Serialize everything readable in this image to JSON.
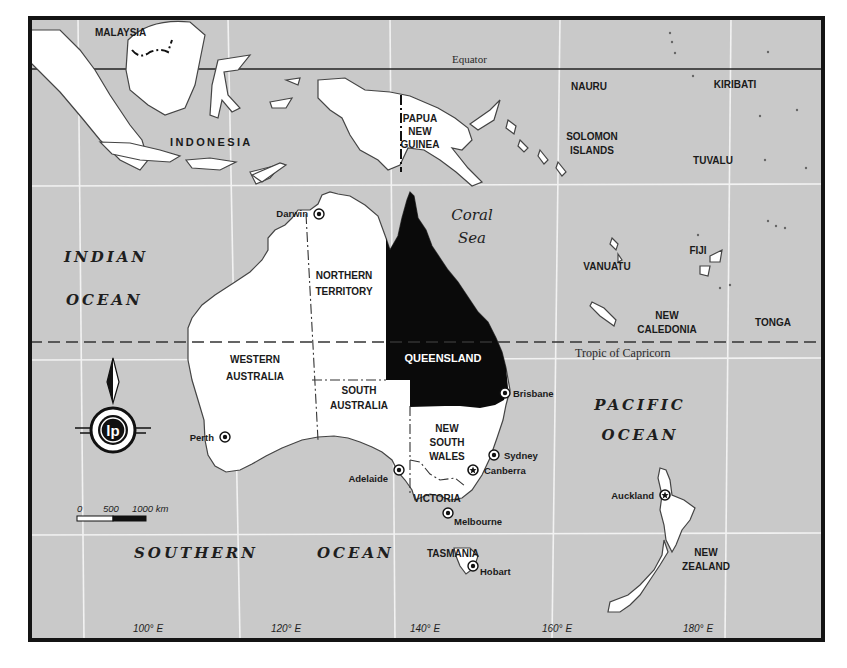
{
  "map": {
    "colors": {
      "sea": "#c9c9c9",
      "land": "#ffffff",
      "highlight_state": "#0a0a0a",
      "frame": "#141414",
      "graticule": "#f2f2f2"
    },
    "reference_lines": {
      "equator": "Equator",
      "tropic": "Tropic of Capricorn"
    },
    "countries": {
      "malaysia": "MALAYSIA",
      "indonesia": "INDONESIA",
      "png_1": "PAPUA",
      "png_2": "NEW",
      "png_3": "GUINEA",
      "nauru": "NAURU",
      "kiribati": "KIRIBATI",
      "solomon_1": "SOLOMON",
      "solomon_2": "ISLANDS",
      "tuvalu": "TUVALU",
      "vanuatu": "VANUATU",
      "fiji": "FIJI",
      "newcal_1": "NEW",
      "newcal_2": "CALEDONIA",
      "tonga": "TONGA",
      "nz_1": "NEW",
      "nz_2": "ZEALAND"
    },
    "seas": {
      "indian_1": "INDIAN",
      "indian_2": "OCEAN",
      "coral_1": "Coral",
      "coral_2": "Sea",
      "pacific_1": "PACIFIC",
      "pacific_2": "OCEAN",
      "southern_1": "SOUTHERN",
      "southern_2": "OCEAN"
    },
    "states": {
      "nt_1": "NORTHERN",
      "nt_2": "TERRITORY",
      "wa_1": "WESTERN",
      "wa_2": "AUSTRALIA",
      "sa_1": "SOUTH",
      "sa_2": "AUSTRALIA",
      "qld": "QUEENSLAND",
      "nsw_1": "NEW",
      "nsw_2": "SOUTH",
      "nsw_3": "WALES",
      "vic": "VICTORIA",
      "tas": "TASMANIA"
    },
    "highlighted_state": "QUEENSLAND",
    "cities": [
      {
        "name": "Darwin",
        "type": "capital-dot"
      },
      {
        "name": "Perth",
        "type": "capital-dot"
      },
      {
        "name": "Brisbane",
        "type": "capital-dot"
      },
      {
        "name": "Sydney",
        "type": "capital-dot"
      },
      {
        "name": "Canberra",
        "type": "national-capital-star"
      },
      {
        "name": "Adelaide",
        "type": "capital-dot"
      },
      {
        "name": "Melbourne",
        "type": "capital-dot"
      },
      {
        "name": "Hobart",
        "type": "capital-dot"
      },
      {
        "name": "Auckland",
        "type": "star"
      }
    ],
    "longitude_ticks": [
      "100° E",
      "120° E",
      "140° E",
      "160° E",
      "180° E"
    ],
    "scale_bar": {
      "labels": [
        "0",
        "500",
        "1000 km"
      ]
    },
    "compass": {
      "icon": "north-arrow-icon",
      "logo_text": "lp"
    }
  }
}
